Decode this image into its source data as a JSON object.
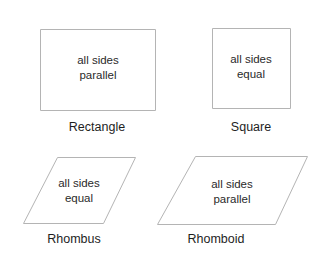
{
  "shapes": [
    {
      "id": "rectangle",
      "name": "Rectangle",
      "text_lines": [
        "all sides",
        "parallel"
      ],
      "points": "40.5,29.5 155.5,29.5 155.5,110.5 40.5,110.5",
      "text_x": 98,
      "text_y1": 64,
      "text_y2": 79,
      "label_x": 97,
      "label_y": 131
    },
    {
      "id": "square",
      "name": "Square",
      "text_lines": [
        "all sides",
        "equal"
      ],
      "points": "212.5,28.5 290.5,28.5 290.5,108.5 212.5,108.5",
      "text_x": 251,
      "text_y1": 63,
      "text_y2": 78,
      "label_x": 251,
      "label_y": 131
    },
    {
      "id": "rhombus",
      "name": "Rhombus",
      "text_lines": [
        "all sides",
        "equal"
      ],
      "points": "57.5,157.5 135.5,157.5 103.5,223.5 23.5,223.5",
      "text_x": 79,
      "text_y1": 187,
      "text_y2": 202,
      "label_x": 74,
      "label_y": 243
    },
    {
      "id": "rhomboid",
      "name": "Rhomboid",
      "text_lines": [
        "all sides",
        "parallel"
      ],
      "points": "195.5,156.5 307.5,156.5 275.5,224.5 157.5,224.5",
      "text_x": 232,
      "text_y1": 188,
      "text_y2": 203,
      "label_x": 216,
      "label_y": 243
    }
  ],
  "colors": {
    "stroke": "#b4b4b4",
    "text": "#2a2a2a",
    "background": "#ffffff"
  }
}
